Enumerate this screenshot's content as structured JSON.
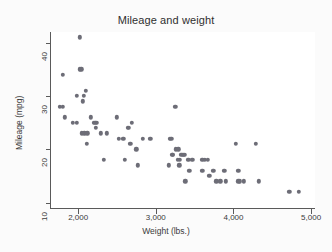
{
  "chart_data": {
    "type": "scatter",
    "title": "Mileage and weight",
    "xlabel": "Weight (lbs.)",
    "ylabel": "Mileage (mpg)",
    "xlim": [
      1650,
      5050
    ],
    "ylim": [
      9,
      42
    ],
    "xticks": [
      2000,
      3000,
      4000,
      5000
    ],
    "xticklabels": [
      "2,000",
      "3,000",
      "4,000",
      "5,000"
    ],
    "yticks": [
      10,
      20,
      30,
      40
    ],
    "yticklabels": [
      "10",
      "20",
      "30",
      "40"
    ],
    "grid": false,
    "legend": null,
    "marker_color": "#6d6d77",
    "background_color": "#fbfbfb",
    "plot_background_color": "#ffffff",
    "axis_color": "#5a5a5a",
    "series": [
      {
        "name": "mpg vs weight",
        "points": [
          [
            1760,
            28
          ],
          [
            1800,
            34
          ],
          [
            1800,
            28
          ],
          [
            1830,
            26
          ],
          [
            1930,
            25
          ],
          [
            1980,
            25
          ],
          [
            1980,
            30
          ],
          [
            2020,
            41
          ],
          [
            2020,
            35
          ],
          [
            2040,
            35
          ],
          [
            2050,
            23
          ],
          [
            2060,
            29
          ],
          [
            2070,
            30
          ],
          [
            2080,
            23
          ],
          [
            2100,
            31
          ],
          [
            2110,
            21
          ],
          [
            2120,
            23
          ],
          [
            2160,
            26
          ],
          [
            2200,
            25
          ],
          [
            2220,
            25
          ],
          [
            2230,
            24
          ],
          [
            2240,
            25
          ],
          [
            2290,
            23
          ],
          [
            2330,
            18
          ],
          [
            2370,
            23
          ],
          [
            2500,
            26
          ],
          [
            2520,
            22
          ],
          [
            2580,
            22
          ],
          [
            2600,
            18
          ],
          [
            2640,
            24
          ],
          [
            2650,
            24
          ],
          [
            2670,
            21
          ],
          [
            2690,
            25
          ],
          [
            2750,
            20
          ],
          [
            2770,
            17
          ],
          [
            2830,
            22
          ],
          [
            2930,
            22
          ],
          [
            3170,
            17
          ],
          [
            3180,
            22
          ],
          [
            3200,
            22
          ],
          [
            3210,
            19
          ],
          [
            3220,
            19
          ],
          [
            3250,
            28
          ],
          [
            3260,
            20
          ],
          [
            3280,
            18
          ],
          [
            3290,
            20
          ],
          [
            3300,
            17
          ],
          [
            3310,
            18
          ],
          [
            3330,
            19
          ],
          [
            3350,
            19
          ],
          [
            3360,
            19
          ],
          [
            3370,
            19
          ],
          [
            3380,
            14
          ],
          [
            3420,
            18
          ],
          [
            3430,
            16
          ],
          [
            3470,
            18
          ],
          [
            3600,
            18
          ],
          [
            3600,
            16
          ],
          [
            3630,
            18
          ],
          [
            3670,
            18
          ],
          [
            3690,
            15
          ],
          [
            3740,
            16
          ],
          [
            3780,
            14
          ],
          [
            3830,
            14
          ],
          [
            3880,
            16
          ],
          [
            3900,
            14
          ],
          [
            4030,
            21
          ],
          [
            4060,
            16
          ],
          [
            4060,
            14
          ],
          [
            4080,
            14
          ],
          [
            4130,
            14
          ],
          [
            4290,
            21
          ],
          [
            4330,
            14
          ],
          [
            4720,
            12
          ],
          [
            4840,
            12
          ]
        ]
      }
    ]
  }
}
